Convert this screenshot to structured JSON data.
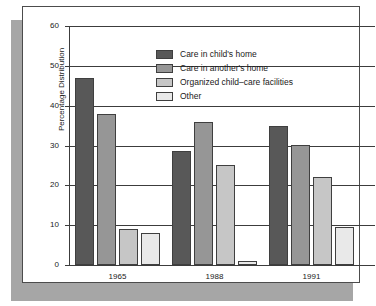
{
  "chart_data": {
    "type": "bar",
    "title": "",
    "xlabel": "",
    "ylabel": "Percentage Distribution",
    "categories": [
      "1965",
      "1988",
      "1991"
    ],
    "ylim": [
      0,
      60
    ],
    "yticks": [
      0,
      10,
      20,
      30,
      40,
      50,
      60
    ],
    "ytick_labels": [
      "0",
      "10",
      "20",
      "30",
      "40",
      "50",
      "60"
    ],
    "grid": true,
    "legend_position": "upper center",
    "series": [
      {
        "name": "Care in child's home",
        "color": "#585858",
        "values": [
          47,
          28.5,
          35
        ]
      },
      {
        "name": "Care in another's home",
        "color": "#969696",
        "values": [
          38,
          36,
          30
        ]
      },
      {
        "name": "Organized child–care facilities",
        "color": "#c6c6c6",
        "values": [
          9,
          25,
          22
        ]
      },
      {
        "name": "Other",
        "color": "#e9e9e9",
        "values": [
          8,
          1,
          9.5
        ]
      }
    ]
  },
  "figure": {
    "card_background": "#ffffff",
    "shadow_color": "#a6a6a6",
    "axis_color": "#3c3c3c",
    "text_color": "#1a1a1a"
  }
}
